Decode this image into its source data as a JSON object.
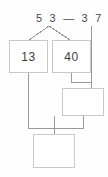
{
  "worksheet": {
    "expression": {
      "minuend": "5 3",
      "operator": "—",
      "subtrahend": "3 7",
      "full": "5 3  —  3 7"
    },
    "boxes": [
      {
        "name": "minuend-part-a",
        "value": "13"
      },
      {
        "name": "minuend-part-b",
        "value": "40"
      },
      {
        "name": "intermediate",
        "value": ""
      },
      {
        "name": "answer",
        "value": ""
      }
    ],
    "colors": {
      "box_border": "#c9c9c9",
      "connector_line": "#9a9a9a",
      "text": "#3d3d3d",
      "expression_text": "#4a4a4a",
      "background": "#fefefe"
    }
  }
}
